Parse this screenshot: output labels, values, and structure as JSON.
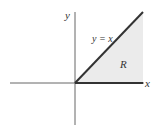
{
  "diagram": {
    "axes": {
      "x_label": "x",
      "y_label": "y"
    },
    "line_label": "y = x",
    "region_label": "R",
    "colors": {
      "axis": "#555555",
      "line": "#333333",
      "region_fill": "#ebebeb"
    }
  }
}
